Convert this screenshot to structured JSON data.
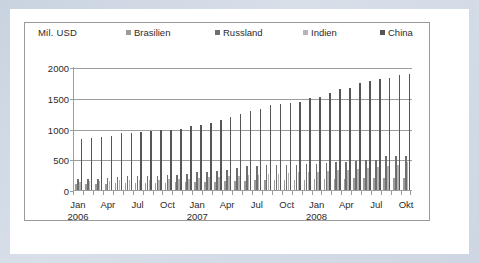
{
  "chart_data": {
    "type": "bar",
    "title": "",
    "subtitle": "",
    "unit_label": "Mil. USD",
    "xlabel": "",
    "ylabel": "Mil. USD",
    "ylim": [
      0,
      2000
    ],
    "ytick_labels": [
      "2000",
      "1500",
      "1000",
      "500",
      "0"
    ],
    "ytick_values": [
      2000,
      1500,
      1000,
      500,
      0
    ],
    "grid": true,
    "legend_position": "top",
    "legend": [
      "Brasilien",
      "Russland",
      "Indien",
      "China"
    ],
    "series_colors": [
      "#9b9b9b",
      "#6e6e6e",
      "#b5b5b5",
      "#565656"
    ],
    "x_tick_labels": [
      {
        "month": "Jan",
        "year": "2006",
        "index": 0
      },
      {
        "month": "Apr",
        "year": "",
        "index": 3
      },
      {
        "month": "Jul",
        "year": "",
        "index": 6
      },
      {
        "month": "Oct",
        "year": "",
        "index": 9
      },
      {
        "month": "Jan",
        "year": "2007",
        "index": 12
      },
      {
        "month": "Apr",
        "year": "",
        "index": 15
      },
      {
        "month": "Jul",
        "year": "",
        "index": 18
      },
      {
        "month": "Oct",
        "year": "",
        "index": 21
      },
      {
        "month": "Jan",
        "year": "2008",
        "index": 24
      },
      {
        "month": "Apr",
        "year": "",
        "index": 27
      },
      {
        "month": "Jul",
        "year": "",
        "index": 30
      },
      {
        "month": "Okt",
        "year": "",
        "index": 33
      }
    ],
    "categories": [
      "Jan 2006",
      "Feb 2006",
      "Mar 2006",
      "Apr 2006",
      "Mai 2006",
      "Jun 2006",
      "Jul 2006",
      "Aug 2006",
      "Sep 2006",
      "Okt 2006",
      "Nov 2006",
      "Dez 2006",
      "Jan 2007",
      "Feb 2007",
      "Mar 2007",
      "Apr 2007",
      "Mai 2007",
      "Jun 2007",
      "Jul 2007",
      "Aug 2007",
      "Sep 2007",
      "Okt 2007",
      "Nov 2007",
      "Dez 2007",
      "Jan 2008",
      "Feb 2008",
      "Mar 2008",
      "Apr 2008",
      "Mai 2008",
      "Jun 2008",
      "Jul 2008",
      "Aug 2008",
      "Sep 2008",
      "Okt 2008"
    ],
    "series": [
      {
        "name": "Brasilien",
        "color": "#9b9b9b",
        "values": [
          95,
          100,
          105,
          105,
          110,
          115,
          110,
          115,
          120,
          120,
          125,
          125,
          130,
          130,
          135,
          140,
          145,
          150,
          155,
          155,
          160,
          160,
          165,
          170,
          175,
          180,
          185,
          185,
          190,
          190,
          195,
          195,
          200,
          200
        ]
      },
      {
        "name": "Russland",
        "color": "#6e6e6e",
        "values": [
          175,
          180,
          180,
          200,
          215,
          225,
          230,
          225,
          235,
          245,
          250,
          255,
          300,
          300,
          310,
          320,
          360,
          385,
          395,
          400,
          410,
          400,
          405,
          415,
          425,
          440,
          460,
          460,
          470,
          480,
          490,
          545,
          560,
          545
        ]
      },
      {
        "name": "Indien",
        "color": "#b5b5b5",
        "values": [
          130,
          140,
          145,
          150,
          155,
          160,
          160,
          165,
          170,
          175,
          180,
          185,
          195,
          205,
          215,
          225,
          235,
          240,
          250,
          255,
          265,
          275,
          285,
          295,
          300,
          310,
          325,
          330,
          345,
          360,
          375,
          385,
          400,
          455
        ]
      },
      {
        "name": "China",
        "color": "#565656",
        "values": [
          830,
          845,
          855,
          885,
          920,
          935,
          950,
          965,
          970,
          975,
          1000,
          1035,
          1050,
          1090,
          1140,
          1190,
          1230,
          1280,
          1320,
          1380,
          1405,
          1420,
          1435,
          1495,
          1510,
          1580,
          1635,
          1665,
          1735,
          1780,
          1800,
          1825,
          1865,
          1885
        ]
      }
    ]
  }
}
